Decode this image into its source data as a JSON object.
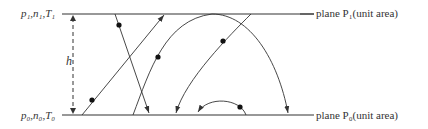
{
  "labels": {
    "top_left": "p₁,n₁,T₁",
    "bottom_left": "p₀,n₀,T₀",
    "height": "h",
    "top_plane": "plane P₁(unit area)",
    "bottom_plane": "plane P₀(unit area)"
  },
  "colors": {
    "line": "#333333",
    "text": "#333333",
    "background": "#ffffff"
  },
  "geometry": {
    "top_plane_y": 14,
    "bottom_plane_y": 115,
    "plane_x_start": 62,
    "plane_x_end": 314
  }
}
